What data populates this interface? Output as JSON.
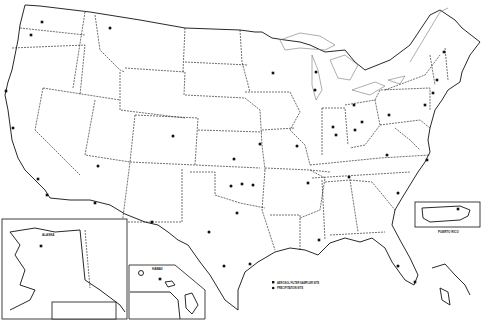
{
  "map": {
    "subject": "United States monitoring site locations",
    "colors": {
      "line": "#111111",
      "background": "#ffffff",
      "lakes": "#777777"
    }
  },
  "insets": {
    "alaska": {
      "label": "ALASKA"
    },
    "hawaii": {
      "label": "HAWAII"
    },
    "puerto_rico": {
      "label": "PUERTO RICO"
    }
  },
  "legend": {
    "items": [
      {
        "marker": "square",
        "label": "AEROSOL FILTER SAMPLER SITE"
      },
      {
        "marker": "circle",
        "label": "PRECIPITATION SITE"
      }
    ]
  },
  "sites": [
    {
      "marker": "square",
      "x": 42,
      "y": 22
    },
    {
      "marker": "square",
      "x": 31,
      "y": 35
    },
    {
      "marker": "circle",
      "x": 110,
      "y": 28
    },
    {
      "marker": "square",
      "x": 6,
      "y": 91
    },
    {
      "marker": "square",
      "x": 13,
      "y": 128
    },
    {
      "marker": "square",
      "x": 38,
      "y": 179
    },
    {
      "marker": "square",
      "x": 47,
      "y": 195
    },
    {
      "marker": "circle",
      "x": 98,
      "y": 166
    },
    {
      "marker": "square",
      "x": 95,
      "y": 203
    },
    {
      "marker": "circle",
      "x": 173,
      "y": 136
    },
    {
      "marker": "circle",
      "x": 234,
      "y": 159
    },
    {
      "marker": "circle",
      "x": 231,
      "y": 186
    },
    {
      "marker": "square",
      "x": 242,
      "y": 184
    },
    {
      "marker": "circle",
      "x": 253,
      "y": 185
    },
    {
      "marker": "square",
      "x": 237,
      "y": 213
    },
    {
      "marker": "circle",
      "x": 209,
      "y": 232
    },
    {
      "marker": "square",
      "x": 152,
      "y": 222
    },
    {
      "marker": "circle",
      "x": 224,
      "y": 266
    },
    {
      "marker": "square",
      "x": 250,
      "y": 264
    },
    {
      "marker": "square",
      "x": 273,
      "y": 73
    },
    {
      "marker": "circle",
      "x": 316,
      "y": 72
    },
    {
      "marker": "circle",
      "x": 315,
      "y": 90
    },
    {
      "marker": "circle",
      "x": 297,
      "y": 146
    },
    {
      "marker": "circle",
      "x": 260,
      "y": 144
    },
    {
      "marker": "square",
      "x": 333,
      "y": 127
    },
    {
      "marker": "square",
      "x": 336,
      "y": 135
    },
    {
      "marker": "square",
      "x": 354,
      "y": 105
    },
    {
      "marker": "square",
      "x": 362,
      "y": 122
    },
    {
      "marker": "square",
      "x": 355,
      "y": 130
    },
    {
      "marker": "circle",
      "x": 349,
      "y": 177
    },
    {
      "marker": "circle",
      "x": 387,
      "y": 155
    },
    {
      "marker": "circle",
      "x": 398,
      "y": 193
    },
    {
      "marker": "square",
      "x": 389,
      "y": 115
    },
    {
      "marker": "square",
      "x": 425,
      "y": 105
    },
    {
      "marker": "square",
      "x": 433,
      "y": 93
    },
    {
      "marker": "square",
      "x": 444,
      "y": 52
    },
    {
      "marker": "square",
      "x": 437,
      "y": 80
    },
    {
      "marker": "square",
      "x": 427,
      "y": 160
    },
    {
      "marker": "circle",
      "x": 398,
      "y": 266
    },
    {
      "marker": "square",
      "x": 415,
      "y": 282
    },
    {
      "marker": "square",
      "x": 308,
      "y": 183
    },
    {
      "marker": "square",
      "x": 319,
      "y": 240
    },
    {
      "marker": "square",
      "x": 41,
      "y": 246
    },
    {
      "marker": "square",
      "x": 160,
      "y": 279
    },
    {
      "marker": "square",
      "x": 458,
      "y": 209
    }
  ]
}
